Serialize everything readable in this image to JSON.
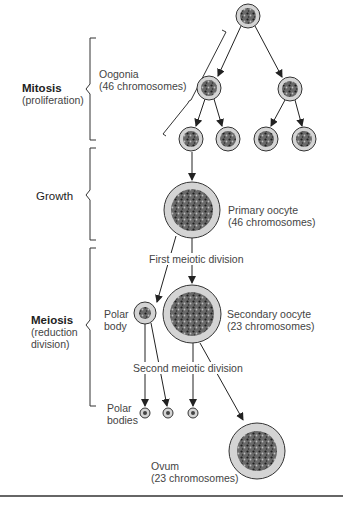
{
  "stages": [
    {
      "title": "Mitosis",
      "subtitle": "(proliferation)"
    },
    {
      "title": "Growth",
      "subtitle": ""
    },
    {
      "title": "Meiosis",
      "subtitle_line1": "(reduction",
      "subtitle_line2": "division)"
    }
  ],
  "labels": {
    "oogonia_name": "Oogonia",
    "oogonia_chromosomes": "(46 chromosomes)",
    "primary_oocyte_name": "Primary oocyte",
    "primary_oocyte_chromosomes": "(46 chromosomes)",
    "first_meiotic_division": "First meiotic division",
    "polar_body_line1": "Polar",
    "polar_body_line2": "body",
    "secondary_oocyte_name": "Secondary oocyte",
    "secondary_oocyte_chromosomes": "(23 chromosomes)",
    "second_meiotic_division": "Second meiotic division",
    "polar_bodies_line1": "Polar",
    "polar_bodies_line2": "bodies",
    "ovum_name": "Ovum",
    "ovum_chromosomes": "(23 chromosomes)"
  },
  "colors": {
    "cell_membrane_fill": "#d4d4d4",
    "nucleus_fill": "#4a4a4a",
    "line": "#222222"
  }
}
